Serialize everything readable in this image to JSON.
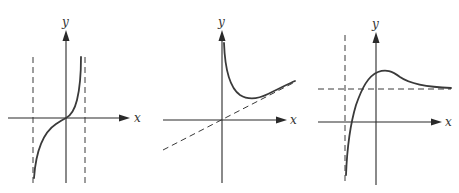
{
  "figure": {
    "panels": [
      {
        "id": "panel-1",
        "axis_labels": {
          "x": "x",
          "y": "y"
        },
        "description": "Odd increasing curve through origin with two vertical asymptotes",
        "asymptotes": [
          "vertical (left)",
          "vertical (right)"
        ]
      },
      {
        "id": "panel-2",
        "axis_labels": {
          "x": "x",
          "y": "y"
        },
        "description": "Curve with vertical asymptote at y-axis, minimum, approaching oblique asymptote through origin",
        "asymptotes": [
          "vertical (y-axis)",
          "oblique through origin"
        ]
      },
      {
        "id": "panel-3",
        "axis_labels": {
          "x": "x",
          "y": "y"
        },
        "description": "Curve rising from vertical asymptote, crossing horizontal asymptote, local maximum, then approaching horizontal asymptote from above",
        "asymptotes": [
          "vertical (left of y-axis)",
          "horizontal (above x-axis)"
        ]
      }
    ]
  }
}
